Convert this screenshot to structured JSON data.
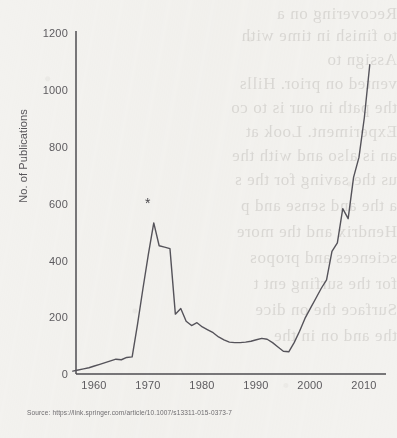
{
  "chart_data": {
    "type": "line",
    "title": "",
    "xlabel": "",
    "ylabel": "No. of Publications",
    "xlim": [
      1955,
      2012
    ],
    "ylim": [
      0,
      1200
    ],
    "xticks": [
      1960,
      1970,
      1980,
      1990,
      2000,
      2010
    ],
    "yticks": [
      0,
      200,
      400,
      600,
      800,
      1000,
      1200
    ],
    "grid": false,
    "legend": null,
    "annotations": [
      {
        "label": "*",
        "x": 1970,
        "y": 600,
        "note": "asterisk above 1970 peak"
      }
    ],
    "x": [
      1955,
      1956,
      1957,
      1958,
      1959,
      1960,
      1961,
      1962,
      1963,
      1964,
      1965,
      1966,
      1967,
      1968,
      1969,
      1970,
      1971,
      1972,
      1973,
      1974,
      1975,
      1976,
      1977,
      1978,
      1979,
      1980,
      1981,
      1982,
      1983,
      1984,
      1985,
      1986,
      1987,
      1988,
      1989,
      1990,
      1991,
      1992,
      1993,
      1994,
      1995,
      1996,
      1997,
      1998,
      1999,
      2000,
      2001,
      2002,
      2003,
      2004,
      2005,
      2006,
      2007,
      2008,
      2009,
      2010
    ],
    "values": [
      10,
      14,
      18,
      22,
      28,
      34,
      40,
      46,
      52,
      50,
      58,
      60,
      175,
      300,
      420,
      530,
      450,
      445,
      440,
      210,
      230,
      185,
      170,
      180,
      165,
      155,
      145,
      130,
      120,
      112,
      110,
      110,
      112,
      115,
      120,
      125,
      122,
      110,
      95,
      80,
      78,
      110,
      150,
      195,
      230,
      265,
      300,
      330,
      430,
      460,
      580,
      545,
      690,
      760,
      900,
      1085
    ],
    "series": [
      {
        "name": "No. of Publications",
        "color": "#55535a"
      }
    ]
  },
  "axis": {
    "y_tick_labels": [
      "1200",
      "1000",
      "800",
      "600",
      "400",
      "200",
      "0"
    ],
    "x_tick_labels": [
      "1960",
      "1970",
      "1980",
      "1990",
      "2000",
      "2010"
    ],
    "y_title": "No. of Publications"
  },
  "marker": {
    "symbol": "*"
  },
  "source": {
    "text": "Source: https://link.springer.com/article/10.1007/s13311-015-0373-7"
  },
  "ghost": {
    "l1": "Recovering on a",
    "l2": "to finish in time with",
    "l3": "Assign to",
    "l4": "vented on prior. Hills",
    "l5": "the path in our is to co",
    "l6": "Experiment. Look at",
    "l7": "an is also and with the",
    "l8": "us the saving for the s",
    "l9": "a the and sense and p",
    "l10": "Hendrix and the more",
    "l11": "sciences and propos",
    "l12": "for the surfing ent t",
    "l13": "Surface the on dice",
    "l14": "the and on in the"
  },
  "colors": {
    "paper": "#f3f2ef",
    "line": "#55535a",
    "axis": "#4e4c50",
    "text": "#5c5a5e"
  }
}
